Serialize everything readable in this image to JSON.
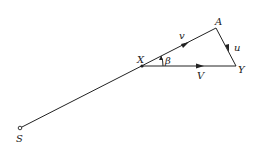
{
  "diagram": {
    "points": {
      "S": {
        "label": "S"
      },
      "X": {
        "label": "X"
      },
      "A": {
        "label": "A"
      },
      "Y": {
        "label": "Y"
      }
    },
    "vectors": {
      "v": {
        "label": "v"
      },
      "u": {
        "label": "u"
      },
      "V": {
        "label": "V"
      }
    },
    "angle": {
      "label": "β"
    },
    "colors": {
      "line": "#222222",
      "background": "#ffffff"
    }
  }
}
